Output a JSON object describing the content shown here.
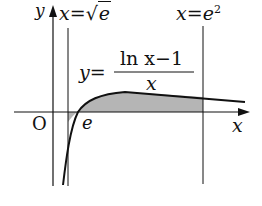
{
  "diagram": {
    "axes": {
      "x_label": "x",
      "y_label": "y",
      "origin_label": "O"
    },
    "curve": {
      "equation_lhs": "y=",
      "numerator": "ln x−1",
      "denominator": "x"
    },
    "vertical_lines": [
      {
        "label_lhs": "x=",
        "label_rhs": "√e",
        "radicand": "e"
      },
      {
        "label_lhs": "x=",
        "base": "e",
        "exponent": "2"
      }
    ],
    "root_label": "e",
    "colors": {
      "stroke": "#111111",
      "shade": "#b5b5b5"
    }
  }
}
